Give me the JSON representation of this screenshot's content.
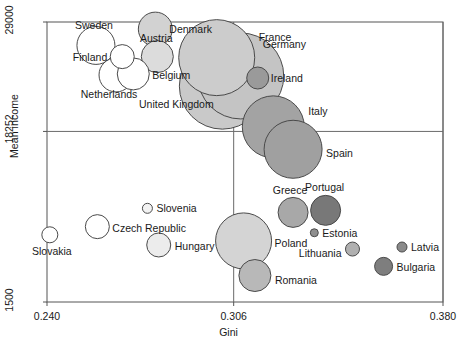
{
  "chart_data": {
    "type": "scatter",
    "title": "",
    "xlabel": "Gini",
    "ylabel": "Mean income",
    "xlim": [
      0.24,
      0.38
    ],
    "ylim": [
      1500,
      29000
    ],
    "xticks": [
      "0.240",
      "0.306",
      "0.380"
    ],
    "xtick_values": [
      0.24,
      0.306,
      0.38
    ],
    "yticks": [
      "29000",
      "18252",
      "1500"
    ],
    "ytick_values": [
      29000,
      18252,
      1500
    ],
    "grid": "reference lines at x=0.306 and y=18252",
    "legend": "none",
    "note": "Bubble area encodes population size; fill darkness varies by country",
    "points": [
      {
        "label": "Sweden",
        "x": 0.2573,
        "y": 26700,
        "size": 19,
        "fill": "#ffffff",
        "label_dx": -2,
        "label_dy": -16,
        "label_anchor": "middle"
      },
      {
        "label": "Denmark",
        "x": 0.2783,
        "y": 28300,
        "size": 17,
        "fill": "#d2d2d2",
        "label_dx": 14,
        "label_dy": 4,
        "label_anchor": "start"
      },
      {
        "label": "Austria",
        "x": 0.279,
        "y": 25600,
        "size": 16,
        "fill": "#dcdcdc",
        "label_dx": -1,
        "label_dy": -15,
        "label_anchor": "middle"
      },
      {
        "label": "Finland",
        "x": 0.2666,
        "y": 25600,
        "size": 12,
        "fill": "#ffffff",
        "label_dx": -15,
        "label_dy": 4,
        "label_anchor": "end"
      },
      {
        "label": "Belgium",
        "x": 0.2705,
        "y": 23900,
        "size": 16,
        "fill": "#ffffff",
        "label_dx": 19,
        "label_dy": 5,
        "label_anchor": "start"
      },
      {
        "label": "Netherlands",
        "x": 0.2644,
        "y": 23800,
        "size": 17,
        "fill": "#ffffff",
        "label_dx": -7,
        "label_dy": 23,
        "label_anchor": "middle"
      },
      {
        "label": "France",
        "x": 0.3,
        "y": 25500,
        "size": 38,
        "fill": "#cccccc",
        "label_dx": 42,
        "label_dy": -17,
        "label_anchor": "start"
      },
      {
        "label": "United Kingdom",
        "x": 0.302,
        "y": 22700,
        "size": 43,
        "fill": "#c9c9c9",
        "label_dx": -46,
        "label_dy": 22,
        "label_anchor": "middle"
      },
      {
        "label": "Germany",
        "x": 0.3085,
        "y": 23700,
        "size": 43,
        "fill": "#c4c4c4",
        "label_dx": 22,
        "label_dy": -28,
        "label_anchor": "start"
      },
      {
        "label": "Ireland",
        "x": 0.3145,
        "y": 23500,
        "size": 11,
        "fill": "#9a9a9a",
        "label_dx": 13,
        "label_dy": 4,
        "label_anchor": "start"
      },
      {
        "label": "Italy",
        "x": 0.32,
        "y": 18700,
        "size": 31,
        "fill": "#a3a3a3",
        "label_dx": 35,
        "label_dy": -12,
        "label_anchor": "start"
      },
      {
        "label": "Spain",
        "x": 0.327,
        "y": 16500,
        "size": 29,
        "fill": "#a0a0a0",
        "label_dx": 33,
        "label_dy": 8,
        "label_anchor": "start"
      },
      {
        "label": "Slovenia",
        "x": 0.2755,
        "y": 10700,
        "size": 5,
        "fill": "#f2f2f2",
        "label_dx": 9,
        "label_dy": 4,
        "label_anchor": "start"
      },
      {
        "label": "Czech Republic",
        "x": 0.2578,
        "y": 8900,
        "size": 12,
        "fill": "#ffffff",
        "label_dx": 15,
        "label_dy": 5,
        "label_anchor": "start"
      },
      {
        "label": "Slovakia",
        "x": 0.241,
        "y": 8100,
        "size": 8,
        "fill": "#ffffff",
        "label_dx": 2,
        "label_dy": 20,
        "label_anchor": "middle"
      },
      {
        "label": "Hungary",
        "x": 0.2795,
        "y": 7100,
        "size": 12,
        "fill": "#ececec",
        "label_dx": 16,
        "label_dy": 5,
        "label_anchor": "start"
      },
      {
        "label": "Poland",
        "x": 0.3095,
        "y": 7500,
        "size": 28,
        "fill": "#d4d4d4",
        "label_dx": 31,
        "label_dy": 6,
        "label_anchor": "start"
      },
      {
        "label": "Romania",
        "x": 0.3135,
        "y": 4100,
        "size": 16,
        "fill": "#b8b8b8",
        "label_dx": 20,
        "label_dy": 8,
        "label_anchor": "start"
      },
      {
        "label": "Greece",
        "x": 0.327,
        "y": 10300,
        "size": 15,
        "fill": "#a8a8a8",
        "label_dx": -3,
        "label_dy": -18,
        "label_anchor": "middle"
      },
      {
        "label": "Portugal",
        "x": 0.3385,
        "y": 10500,
        "size": 15,
        "fill": "#787878",
        "label_dx": -1,
        "label_dy": -19,
        "label_anchor": "middle"
      },
      {
        "label": "Estonia",
        "x": 0.3345,
        "y": 8300,
        "size": 4,
        "fill": "#8f8f8f",
        "label_dx": 8,
        "label_dy": 4,
        "label_anchor": "start"
      },
      {
        "label": "Lithuania",
        "x": 0.348,
        "y": 6700,
        "size": 7,
        "fill": "#b0b0b0",
        "label_dx": -11,
        "label_dy": 8,
        "label_anchor": "end"
      },
      {
        "label": "Latvia",
        "x": 0.3655,
        "y": 6900,
        "size": 5,
        "fill": "#8a8a8a",
        "label_dx": 9,
        "label_dy": 4,
        "label_anchor": "start"
      },
      {
        "label": "Bulgaria",
        "x": 0.359,
        "y": 5000,
        "size": 9,
        "fill": "#7e7e7e",
        "label_dx": 13,
        "label_dy": 5,
        "label_anchor": "start"
      }
    ]
  },
  "axes": {
    "ylabel": "Mean income",
    "xlabel": "Gini",
    "yticks": [
      {
        "text": "29000"
      },
      {
        "text": "18252"
      },
      {
        "text": "1500"
      }
    ],
    "xticks": [
      {
        "text": "0.240"
      },
      {
        "text": "0.306"
      },
      {
        "text": "0.380"
      }
    ]
  },
  "style": {
    "axis_color": "#555555",
    "grid_color": "#6a6a6a",
    "bubble_stroke": "#4a4a4a",
    "text_color": "#1a1a1a",
    "background": "#ffffff"
  }
}
